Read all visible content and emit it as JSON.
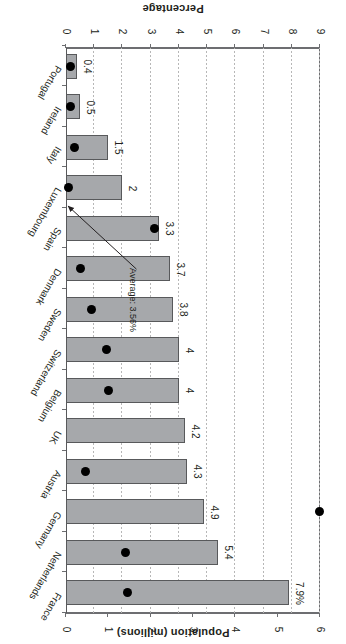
{
  "chart_data": {
    "type": "bar",
    "title": "",
    "orientation": "horizontal",
    "grid": true,
    "categories": [
      "France",
      "Netherlands",
      "Germany",
      "Austria",
      "UK",
      "Belgium",
      "Switzerland",
      "Sweden",
      "Denmark",
      "Spain",
      "Luxembourg",
      "Italy",
      "Ireland",
      "Portugal"
    ],
    "series": [
      {
        "name": "Percentage",
        "axis": "percentage",
        "unit": "%",
        "values": [
          7.9,
          5.4,
          4.9,
          4.3,
          4.2,
          4.0,
          4.0,
          3.8,
          3.7,
          3.3,
          2.0,
          1.5,
          0.5,
          0.4
        ],
        "labels": [
          "7.9%",
          "5.4",
          "4.9",
          "4.3",
          "4.2",
          "4",
          "4",
          "3.8",
          "3.7",
          "3.3",
          "2",
          "1.5",
          "0.5",
          "0.4"
        ]
      },
      {
        "name": "Population in millions",
        "axis": "population",
        "unit": "millions",
        "values": [
          1.45,
          1.4,
          6.0,
          0.45,
          0.0,
          1.0,
          0.95,
          0.6,
          0.35,
          2.1,
          0.05,
          0.2,
          0.1,
          0.1
        ]
      }
    ],
    "percentage_axis": {
      "label": "Percentage",
      "ticks": [
        0,
        1,
        2,
        3,
        4,
        5,
        6,
        7,
        8,
        9
      ],
      "ticklabels": [
        "0",
        "1",
        "2",
        "3",
        "4",
        "5",
        "6",
        "7",
        "8",
        "9"
      ],
      "lim": [
        0,
        9
      ]
    },
    "population_axis": {
      "label": "Population (millions)",
      "ticks": [
        0,
        1,
        2,
        3,
        4,
        5,
        6
      ],
      "ticklabels": [
        "0",
        "1",
        "2",
        "3",
        "4",
        "5",
        "6"
      ],
      "lim": [
        0,
        6
      ]
    },
    "annotation": {
      "text": "Average: 3.56%",
      "value": 3.56,
      "points_to": "Spain"
    },
    "legend": {
      "position": "top-left",
      "entries": [
        {
          "label": "Percentage",
          "marker": "square",
          "color": "#a6a8ab"
        },
        {
          "label": "Population in millions",
          "marker": "dot",
          "color": "#000000"
        }
      ]
    }
  }
}
